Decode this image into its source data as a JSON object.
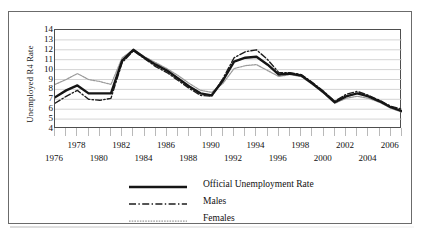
{
  "chart_data": {
    "type": "line",
    "title": "",
    "xlabel": "",
    "ylabel": "Unemployed R4 Rate",
    "ylim": [
      4,
      14
    ],
    "yticks": [
      14,
      13,
      12,
      11,
      10,
      9,
      8,
      7,
      6,
      5,
      4
    ],
    "xlim": [
      1976,
      2007
    ],
    "grid": true,
    "grid_axis": "y",
    "legend_position": "below-plot",
    "xticks_top_row": [
      1978,
      1982,
      1986,
      1990,
      1994,
      1998,
      2002,
      2006
    ],
    "xticks_bottom_row": [
      1976,
      1980,
      1984,
      1988,
      1992,
      1996,
      2000,
      2004
    ],
    "x": [
      1976,
      1977,
      1978,
      1979,
      1980,
      1981,
      1982,
      1983,
      1984,
      1985,
      1986,
      1987,
      1988,
      1989,
      1990,
      1991,
      1992,
      1993,
      1994,
      1995,
      1996,
      1997,
      1998,
      1999,
      2000,
      2001,
      2002,
      2003,
      2004,
      2005,
      2006,
      2007
    ],
    "series": [
      {
        "name": "Official Unemployment Rate",
        "style": "solid-thick",
        "color": "#151515",
        "values": [
          7.2,
          7.9,
          8.4,
          7.6,
          7.6,
          7.6,
          10.9,
          12.0,
          11.2,
          10.5,
          9.9,
          9.1,
          8.3,
          7.6,
          7.4,
          8.9,
          10.8,
          11.2,
          11.3,
          10.5,
          9.5,
          9.6,
          9.4,
          8.6,
          7.7,
          6.7,
          7.3,
          7.6,
          7.3,
          6.8,
          6.2,
          5.8
        ]
      },
      {
        "name": "Males",
        "style": "dash-dot",
        "color": "#1d1d1d",
        "values": [
          6.6,
          7.3,
          7.9,
          7.0,
          6.9,
          7.1,
          10.7,
          11.9,
          11.1,
          10.3,
          9.7,
          8.9,
          8.1,
          7.4,
          7.3,
          9.1,
          11.2,
          11.8,
          12.0,
          11.0,
          9.7,
          9.7,
          9.5,
          8.7,
          7.8,
          6.8,
          7.5,
          7.8,
          7.4,
          6.9,
          6.3,
          6.0
        ]
      },
      {
        "name": "Females",
        "style": "dotted-light",
        "color": "#9a9a9a",
        "values": [
          8.5,
          9.0,
          9.6,
          9.0,
          8.8,
          8.5,
          11.2,
          12.0,
          11.3,
          10.7,
          10.1,
          9.4,
          8.6,
          7.9,
          7.7,
          8.6,
          10.1,
          10.4,
          10.5,
          9.9,
          9.3,
          9.5,
          9.3,
          8.5,
          7.6,
          6.6,
          7.1,
          7.3,
          7.1,
          6.7,
          6.1,
          5.7
        ]
      }
    ]
  },
  "legend": {
    "items": [
      {
        "label": "Official Unemployment Rate",
        "key": "solid-thick-key"
      },
      {
        "label": "Males",
        "key": "dash-dot-key"
      },
      {
        "label": "Females",
        "key": "dotted-light-key"
      }
    ]
  },
  "colors": {
    "figure_border": "#6b6b6b",
    "plot_border": "#4e4e4e",
    "gridline": "#cfcfcf",
    "tick": "#b9b9b9",
    "text": "#101010"
  }
}
